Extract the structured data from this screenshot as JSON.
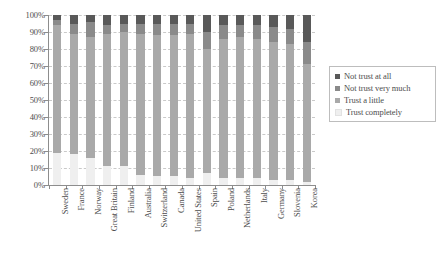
{
  "chart_data": {
    "type": "bar",
    "subtype": "100%-stacked-bar",
    "title": "",
    "xlabel": "",
    "ylabel": "",
    "ylim": [
      0,
      100
    ],
    "grid": true,
    "legend_position": "right",
    "ytick_labels": [
      "100%",
      "90%",
      "80%",
      "70%",
      "60%",
      "50%",
      "40%",
      "30%",
      "20%",
      "10%",
      "0%"
    ],
    "ytick_values": [
      100,
      90,
      80,
      70,
      60,
      50,
      40,
      30,
      20,
      10,
      0
    ],
    "categories": [
      "Sweden",
      "France",
      "Norway",
      "Great Britain",
      "Finland",
      "Australia",
      "Switzerland",
      "Canada",
      "United States",
      "Spain",
      "Poland",
      "Netherlands",
      "Italy",
      "Germany",
      "Slovenia",
      "Korea"
    ],
    "series": [
      {
        "name": "Trust completely",
        "color": "#efefef",
        "values": [
          19,
          18,
          16,
          11,
          11,
          6,
          5,
          5,
          4,
          7,
          4,
          4,
          4,
          3,
          3,
          2
        ]
      },
      {
        "name": "Trust a little",
        "color": "#a9a9a9",
        "values": [
          75,
          71,
          71,
          78,
          79,
          83,
          83,
          83,
          85,
          73,
          82,
          83,
          82,
          81,
          80,
          69
        ]
      },
      {
        "name": "Not trust very much",
        "color": "#8a8a8a",
        "values": [
          3,
          6,
          9,
          5,
          5,
          6,
          7,
          7,
          6,
          10,
          8,
          7,
          8,
          9,
          9,
          13
        ]
      },
      {
        "name": "Not trust at all",
        "color": "#595959",
        "values": [
          3,
          5,
          4,
          6,
          5,
          5,
          5,
          5,
          5,
          10,
          6,
          6,
          6,
          7,
          8,
          16
        ]
      }
    ]
  },
  "legend": {
    "items": [
      {
        "label": "Not trust at all",
        "color": "#595959"
      },
      {
        "label": "Not trust very much",
        "color": "#8a8a8a"
      },
      {
        "label": "Trust a little",
        "color": "#a9a9a9"
      },
      {
        "label": "Trust completely",
        "color": "#efefef"
      }
    ]
  },
  "colors": {
    "axis": "#8d8d8d",
    "grid": "#c9c9c9",
    "text": "#4d4d4d",
    "background": "#ffffff"
  }
}
